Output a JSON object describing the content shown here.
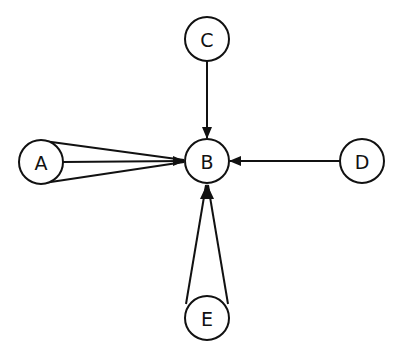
{
  "diagram": {
    "type": "directed-graph",
    "colors": {
      "stroke": "#111111",
      "background": "#ffffff",
      "node_fill": "#ffffff"
    },
    "nodes": [
      {
        "id": "A",
        "label": "A",
        "cx": 41,
        "cy": 162,
        "r": 22
      },
      {
        "id": "B",
        "label": "B",
        "cx": 207,
        "cy": 161,
        "r": 22
      },
      {
        "id": "C",
        "label": "C",
        "cx": 207,
        "cy": 39,
        "r": 22
      },
      {
        "id": "D",
        "label": "D",
        "cx": 362,
        "cy": 161,
        "r": 22
      },
      {
        "id": "E",
        "label": "E",
        "cx": 207,
        "cy": 318,
        "r": 22
      }
    ],
    "edges": [
      {
        "from": "A",
        "to": "B",
        "count": 3,
        "style": "fan"
      },
      {
        "from": "C",
        "to": "B",
        "count": 1
      },
      {
        "from": "D",
        "to": "B",
        "count": 1
      },
      {
        "from": "E",
        "to": "B",
        "count": 2,
        "style": "fan"
      }
    ]
  }
}
